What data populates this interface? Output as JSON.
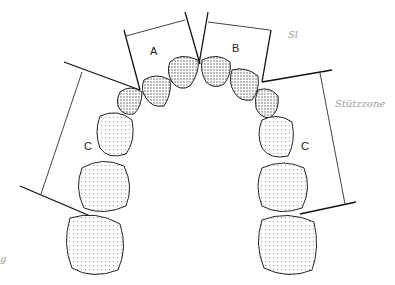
{
  "diagram": {
    "type": "dental-arch-space-analysis",
    "labels": {
      "a": "A",
      "b": "B",
      "c_left": "C",
      "c_right": "C",
      "handwritten_top": "Sl",
      "handwritten_side": "Stützzone",
      "margin_mark": "g"
    },
    "segments": [
      {
        "id": "A",
        "description": "left anterior segment (incisors to canine)"
      },
      {
        "id": "B",
        "description": "right anterior segment (incisors to canine)"
      },
      {
        "id": "C",
        "description": "support zone (canine to first molar), left"
      },
      {
        "id": "C",
        "description": "support zone (canine to first molar), right"
      }
    ],
    "colors": {
      "line": "#111111",
      "tooth_shade": "#555555",
      "annotation": "#9a9a9a"
    }
  }
}
